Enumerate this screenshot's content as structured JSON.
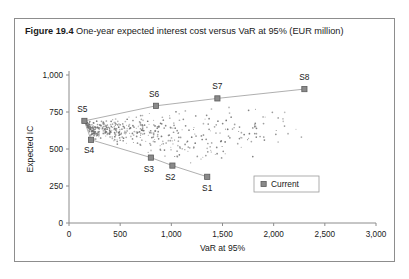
{
  "caption": {
    "label": "Figure 19.4",
    "text": "One-year expected interest cost versus VaR at 95% (EUR million)"
  },
  "legend": {
    "entries": [
      {
        "label": "Current",
        "color": "#8a8a8a",
        "marker": "square"
      }
    ]
  },
  "chart_data": {
    "type": "scatter",
    "title": "",
    "xlabel": "VaR at 95%",
    "ylabel": "Expected IC",
    "xlim": [
      0,
      3000
    ],
    "ylim": [
      0,
      1000
    ],
    "xticks": [
      0,
      500,
      1000,
      1500,
      2000,
      2500,
      3000
    ],
    "xticklabels": [
      "0",
      "500",
      "1,000",
      "1,500",
      "2,000",
      "2,500",
      "3,000"
    ],
    "yticks": [
      0,
      250,
      500,
      750,
      1000
    ],
    "yticklabels": [
      "0",
      "250",
      "500",
      "750",
      "1,000"
    ],
    "grid": false,
    "legend_position": "lower-right",
    "series": [
      {
        "name": "Current",
        "color": "#8a8a8a",
        "points": [
          {
            "label": "S5",
            "x": 150,
            "y": 690,
            "label_dx": -2,
            "label_dy": -9
          },
          {
            "label": "S4",
            "x": 215,
            "y": 562,
            "label_dx": -2,
            "label_dy": 13
          },
          {
            "label": "S3",
            "x": 800,
            "y": 442,
            "label_dx": -2,
            "label_dy": 14
          },
          {
            "label": "S2",
            "x": 1010,
            "y": 388,
            "label_dx": -2,
            "label_dy": 14
          },
          {
            "label": "S1",
            "x": 1350,
            "y": 312,
            "label_dx": 0,
            "label_dy": 14
          },
          {
            "label": "S6",
            "x": 850,
            "y": 792,
            "label_dx": -2,
            "label_dy": -9
          },
          {
            "label": "S7",
            "x": 1450,
            "y": 842,
            "label_dx": 0,
            "label_dy": -9
          },
          {
            "label": "S8",
            "x": 2300,
            "y": 905,
            "label_dx": 0,
            "label_dy": -9
          }
        ]
      }
    ],
    "frontier_upper": [
      {
        "x": 150,
        "y": 690
      },
      {
        "x": 850,
        "y": 792
      },
      {
        "x": 1450,
        "y": 842
      },
      {
        "x": 2300,
        "y": 905
      }
    ],
    "frontier_lower": [
      {
        "x": 150,
        "y": 690
      },
      {
        "x": 215,
        "y": 562
      },
      {
        "x": 800,
        "y": 442
      },
      {
        "x": 1010,
        "y": 388
      },
      {
        "x": 1350,
        "y": 312
      }
    ],
    "cloud_description": "Dense wedge-shaped cluster of small scenario dots fanning rightward from the S5 vertex, bounded above by the upper efficient frontier and below by the lower frontier, thinning toward the right.",
    "cloud_point_count": 620
  }
}
